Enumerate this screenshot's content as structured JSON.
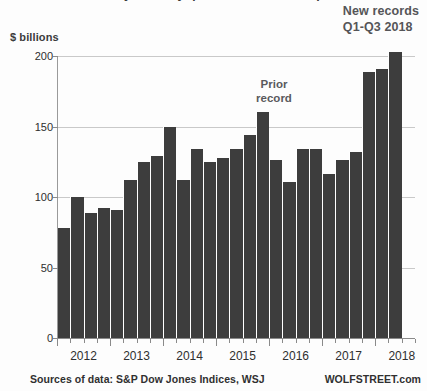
{
  "title": "Stock buybacks by quarter, S&P 500 companies",
  "axis_unit_label": "$ billions",
  "annotations": {
    "new_records_line1": "New records",
    "new_records_line2": "Q1-Q3 2018",
    "prior_record_line1": "Prior",
    "prior_record_line2": "record"
  },
  "footer": {
    "sources": "Sources of data: S&P Dow Jones Indices, WSJ",
    "brand": "WOLFSTREET.com"
  },
  "colors": {
    "bar": "#3d3d3d",
    "gridline": "#c9c9c9",
    "axis": "#8a8a8a",
    "annotation_text": "#555558",
    "label_text": "#2e2e2e"
  },
  "chart_data": {
    "type": "bar",
    "title": "Stock buybacks by quarter, S&P 500 companies",
    "xlabel": "",
    "ylabel": "$ billions",
    "ylim": [
      0,
      200
    ],
    "yticks": [
      0,
      50,
      100,
      150,
      200
    ],
    "ytick_labels": [
      "0",
      "50",
      "100",
      "150",
      "200"
    ],
    "grid": true,
    "legend": false,
    "xtick_labels": [
      "2012",
      "2013",
      "2014",
      "2015",
      "2016",
      "2017",
      "2018"
    ],
    "categories": [
      "2012 Q1",
      "2012 Q2",
      "2012 Q3",
      "2012 Q4",
      "2013 Q1",
      "2013 Q2",
      "2013 Q3",
      "2013 Q4",
      "2014 Q1",
      "2014 Q2",
      "2014 Q3",
      "2014 Q4",
      "2015 Q1",
      "2015 Q2",
      "2015 Q3",
      "2015 Q4",
      "2016 Q1",
      "2016 Q2",
      "2016 Q3",
      "2016 Q4",
      "2017 Q1",
      "2017 Q2",
      "2017 Q3",
      "2017 Q4",
      "2018 Q1",
      "2018 Q2",
      "2018 Q3"
    ],
    "values": [
      78,
      100,
      89,
      92,
      91,
      112,
      125,
      129,
      150,
      112,
      134,
      125,
      128,
      134,
      144,
      160,
      126,
      111,
      134,
      134,
      116,
      126,
      132,
      189,
      191,
      203,
      0
    ],
    "bars": [
      {
        "label": "2012 Q1",
        "value": 78
      },
      {
        "label": "2012 Q2",
        "value": 100
      },
      {
        "label": "2012 Q3",
        "value": 89
      },
      {
        "label": "2012 Q4",
        "value": 92
      },
      {
        "label": "2013 Q1",
        "value": 91
      },
      {
        "label": "2013 Q2",
        "value": 112
      },
      {
        "label": "2013 Q3",
        "value": 125
      },
      {
        "label": "2013 Q4",
        "value": 129
      },
      {
        "label": "2014 Q1",
        "value": 150
      },
      {
        "label": "2014 Q2",
        "value": 112
      },
      {
        "label": "2014 Q3",
        "value": 134
      },
      {
        "label": "2014 Q4",
        "value": 125
      },
      {
        "label": "2015 Q1",
        "value": 128
      },
      {
        "label": "2015 Q2",
        "value": 134
      },
      {
        "label": "2015 Q3",
        "value": 144
      },
      {
        "label": "2015 Q4",
        "value": 160
      },
      {
        "label": "2016 Q1",
        "value": 126
      },
      {
        "label": "2016 Q2",
        "value": 111
      },
      {
        "label": "2016 Q3",
        "value": 134
      },
      {
        "label": "2016 Q4",
        "value": 134
      },
      {
        "label": "2017 Q1",
        "value": 116
      },
      {
        "label": "2017 Q2",
        "value": 126
      },
      {
        "label": "2017 Q3",
        "value": 132
      },
      {
        "label": "2017 Q4",
        "value": 189
      },
      {
        "label": "2018 Q1",
        "value": 191
      },
      {
        "label": "2018 Q2",
        "value": 203
      }
    ],
    "annotations": [
      {
        "text": "Prior record",
        "target": "2015 Q4"
      },
      {
        "text": "New records Q1-Q3 2018",
        "target": "2018 Q3"
      }
    ]
  }
}
